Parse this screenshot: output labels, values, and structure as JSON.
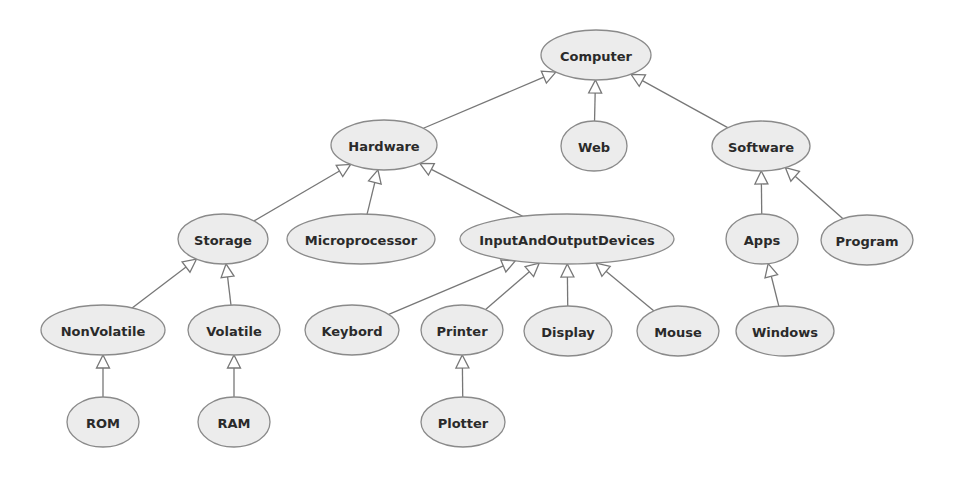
{
  "diagram": {
    "type": "class-hierarchy",
    "colors": {
      "node_fill": "#ececec",
      "node_stroke": "#8a8a8a",
      "edge": "#777777",
      "text": "#2a2a2a",
      "background": "#ffffff"
    },
    "nodes": [
      {
        "id": "Computer",
        "label": "Computer",
        "cx": 596,
        "cy": 55,
        "rx": 55,
        "ry": 25
      },
      {
        "id": "Hardware",
        "label": "Hardware",
        "cx": 384,
        "cy": 145,
        "rx": 53,
        "ry": 25
      },
      {
        "id": "Web",
        "label": "Web",
        "cx": 594,
        "cy": 146,
        "rx": 33,
        "ry": 25
      },
      {
        "id": "Software",
        "label": "Software",
        "cx": 761,
        "cy": 146,
        "rx": 49,
        "ry": 25
      },
      {
        "id": "Storage",
        "label": "Storage",
        "cx": 223,
        "cy": 239,
        "rx": 45,
        "ry": 25
      },
      {
        "id": "Microprocessor",
        "label": "Microprocessor",
        "cx": 361,
        "cy": 239,
        "rx": 74,
        "ry": 25
      },
      {
        "id": "InputAndOutputDevices",
        "label": "InputAndOutputDevices",
        "cx": 567,
        "cy": 239,
        "rx": 107,
        "ry": 25
      },
      {
        "id": "Apps",
        "label": "Apps",
        "cx": 762,
        "cy": 239,
        "rx": 36,
        "ry": 25
      },
      {
        "id": "Program",
        "label": "Program",
        "cx": 867,
        "cy": 240,
        "rx": 46,
        "ry": 25
      },
      {
        "id": "NonVolatile",
        "label": "NonVolatile",
        "cx": 103,
        "cy": 330,
        "rx": 62,
        "ry": 25
      },
      {
        "id": "Volatile",
        "label": "Volatile",
        "cx": 234,
        "cy": 330,
        "rx": 46,
        "ry": 25
      },
      {
        "id": "Keybord",
        "label": "Keybord",
        "cx": 352,
        "cy": 330,
        "rx": 47,
        "ry": 25
      },
      {
        "id": "Printer",
        "label": "Printer",
        "cx": 462,
        "cy": 330,
        "rx": 41,
        "ry": 25
      },
      {
        "id": "Display",
        "label": "Display",
        "cx": 568,
        "cy": 331,
        "rx": 44,
        "ry": 25
      },
      {
        "id": "Mouse",
        "label": "Mouse",
        "cx": 678,
        "cy": 331,
        "rx": 41,
        "ry": 25
      },
      {
        "id": "Windows",
        "label": "Windows",
        "cx": 785,
        "cy": 331,
        "rx": 49,
        "ry": 25
      },
      {
        "id": "ROM",
        "label": "ROM",
        "cx": 103,
        "cy": 422,
        "rx": 36,
        "ry": 25
      },
      {
        "id": "RAM",
        "label": "RAM",
        "cx": 234,
        "cy": 422,
        "rx": 36,
        "ry": 25
      },
      {
        "id": "Plotter",
        "label": "Plotter",
        "cx": 463,
        "cy": 422,
        "rx": 42,
        "ry": 25
      }
    ],
    "edges": [
      {
        "from": "Hardware",
        "to": "Computer",
        "arrow": "hollow-triangle"
      },
      {
        "from": "Web",
        "to": "Computer",
        "arrow": "hollow-triangle"
      },
      {
        "from": "Software",
        "to": "Computer",
        "arrow": "hollow-triangle"
      },
      {
        "from": "Storage",
        "to": "Hardware",
        "arrow": "hollow-triangle"
      },
      {
        "from": "Microprocessor",
        "to": "Hardware",
        "arrow": "hollow-triangle"
      },
      {
        "from": "InputAndOutputDevices",
        "to": "Hardware",
        "arrow": "hollow-triangle"
      },
      {
        "from": "Apps",
        "to": "Software",
        "arrow": "hollow-triangle"
      },
      {
        "from": "Program",
        "to": "Software",
        "arrow": "hollow-triangle"
      },
      {
        "from": "NonVolatile",
        "to": "Storage",
        "arrow": "hollow-triangle"
      },
      {
        "from": "Volatile",
        "to": "Storage",
        "arrow": "hollow-triangle"
      },
      {
        "from": "Keybord",
        "to": "InputAndOutputDevices",
        "arrow": "hollow-triangle"
      },
      {
        "from": "Printer",
        "to": "InputAndOutputDevices",
        "arrow": "hollow-triangle"
      },
      {
        "from": "Display",
        "to": "InputAndOutputDevices",
        "arrow": "hollow-triangle"
      },
      {
        "from": "Mouse",
        "to": "InputAndOutputDevices",
        "arrow": "hollow-triangle"
      },
      {
        "from": "Windows",
        "to": "Apps",
        "arrow": "hollow-triangle"
      },
      {
        "from": "ROM",
        "to": "NonVolatile",
        "arrow": "hollow-triangle"
      },
      {
        "from": "RAM",
        "to": "Volatile",
        "arrow": "hollow-triangle"
      },
      {
        "from": "Plotter",
        "to": "Printer",
        "arrow": "hollow-triangle"
      }
    ]
  }
}
